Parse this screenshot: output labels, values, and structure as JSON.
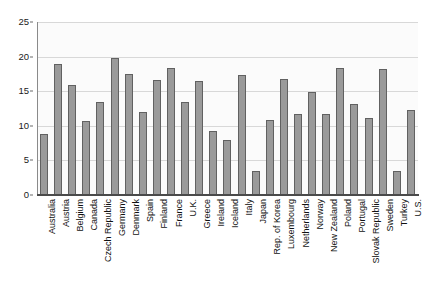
{
  "chart_data": {
    "type": "bar",
    "title": "",
    "subtitle": "",
    "xlabel": "",
    "ylabel": "",
    "ylim": [
      0,
      25
    ],
    "ytick_values": [
      0,
      5,
      10,
      15,
      20,
      25
    ],
    "ytick_labels": [
      "0",
      "5",
      "10",
      "15",
      "20",
      "25"
    ],
    "grid": true,
    "legend": false,
    "categories": [
      "Australia",
      "Austria",
      "Belgium",
      "Canada",
      "Czech Republic",
      "Germany",
      "Denmark",
      "Spain",
      "Finland",
      "France",
      "U.K.",
      "Greece",
      "Ireland",
      "Iceland",
      "Italy",
      "Japan",
      "Rep. of Korea",
      "Luxembourg",
      "Netherlands",
      "Norway",
      "New Zealand",
      "Poland",
      "Portugal",
      "Slovak Republic",
      "Sweden",
      "Turkey",
      "U.S."
    ],
    "values": [
      8.8,
      19.0,
      15.9,
      10.7,
      13.5,
      19.8,
      17.5,
      12.0,
      16.6,
      18.3,
      13.5,
      16.5,
      9.2,
      8.0,
      17.3,
      3.5,
      10.8,
      16.7,
      11.7,
      14.9,
      11.7,
      18.4,
      13.1,
      11.1,
      18.2,
      3.5,
      12.3
    ],
    "bar_color": "#9a9a9a",
    "bar_border_color": "#616161",
    "gridline_color": "#d8d8d8",
    "axis_color": "#4a4a4a",
    "plot_background": "#fbfbfb"
  }
}
